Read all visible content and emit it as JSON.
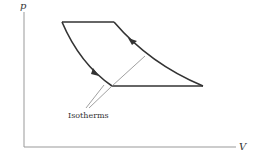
{
  "diagram": {
    "type": "pV-cycle",
    "axes": {
      "y_label": "p",
      "x_label": "V"
    },
    "annotation": "Isotherms",
    "colors": {
      "stroke": "#333333",
      "thin": "#888888"
    }
  }
}
